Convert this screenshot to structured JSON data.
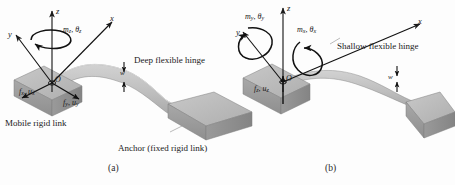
{
  "figure": {
    "panels": [
      {
        "id": "a",
        "caption": "(a)",
        "axes": {
          "x": "x",
          "y": "y",
          "z": "z",
          "origin": "O"
        },
        "moments": [
          {
            "symbol": "m",
            "sub": "z",
            "theta": "θ",
            "theta_sub": "z",
            "text": "m z ,  θ z"
          }
        ],
        "forces": [
          {
            "symbol": "f",
            "sub": "x",
            "disp": "u",
            "disp_sub": "x"
          },
          {
            "symbol": "f",
            "sub": "y",
            "disp": "u",
            "disp_sub": "y"
          }
        ],
        "dimension": {
          "label": "w"
        },
        "annotations": [
          {
            "name": "hinge-label",
            "text": "Deep flexible hinge"
          },
          {
            "name": "mobile-link-label",
            "text": "Mobile rigid link"
          },
          {
            "name": "anchor-label",
            "text": "Anchor (fixed rigid link)"
          }
        ]
      },
      {
        "id": "b",
        "caption": "(b)",
        "axes": {
          "x": "x",
          "y": "y",
          "z": "z",
          "origin": "O"
        },
        "moments": [
          {
            "symbol": "m",
            "sub": "y",
            "theta": "θ",
            "theta_sub": "y"
          },
          {
            "symbol": "m",
            "sub": "x",
            "theta": "θ",
            "theta_sub": "x"
          }
        ],
        "forces": [
          {
            "symbol": "f",
            "sub": "z",
            "disp": "u",
            "disp_sub": "z"
          }
        ],
        "dimension": {
          "label": "w"
        },
        "annotations": [
          {
            "name": "hinge-label",
            "text": "Shallow flexible hinge"
          }
        ]
      }
    ],
    "glyphs": {
      "comma": ",",
      "theta": "θ"
    },
    "colors": {
      "block_top": "#b9b9b9",
      "block_front": "#a2a2a2",
      "block_side": "#8e8e8e",
      "beam": "#c2c2c2",
      "ink": "#1a1a1a",
      "background": "#fdfdfd"
    }
  }
}
